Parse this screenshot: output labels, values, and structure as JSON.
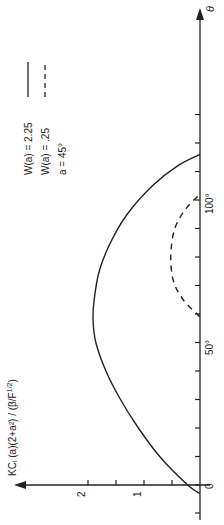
{
  "chart_data": {
    "type": "line",
    "orientation": "rotated-90-ccw",
    "title": "",
    "xlabel": "θ",
    "ylabel": "KCᵢ (a)(2+a²) / (β/F^1/2)",
    "xlim": [
      -5,
      135
    ],
    "ylim": [
      0,
      2.8
    ],
    "x_ticks": [
      0,
      10,
      20,
      30,
      40,
      50,
      60,
      70,
      80,
      90,
      100,
      110,
      120,
      130
    ],
    "x_tick_labels": {
      "0": "0",
      "50": "50°",
      "100": "100°"
    },
    "y_ticks": [
      0,
      0.5,
      1,
      1.5,
      2
    ],
    "y_tick_labels": {
      "1": "1",
      "2": "2"
    },
    "grid": false,
    "legend_position": "upper-left (rotated)",
    "series": [
      {
        "name": "W(a) = 2.25",
        "style": "solid",
        "x": [
          -3,
          0,
          10,
          20,
          30,
          40,
          50,
          58,
          65,
          75,
          85,
          95,
          105,
          112,
          116
        ],
        "values": [
          0,
          0.22,
          0.72,
          1.1,
          1.42,
          1.68,
          1.86,
          1.91,
          1.89,
          1.8,
          1.6,
          1.3,
          0.85,
          0.4,
          0
        ]
      },
      {
        "name": "W(a) = .25",
        "style": "dashed",
        "x": [
          59,
          65,
          72,
          81,
          90,
          97,
          102
        ],
        "values": [
          0,
          0.3,
          0.48,
          0.52,
          0.45,
          0.25,
          0
        ]
      }
    ],
    "annotations": [
      "a = 45°"
    ]
  },
  "legend": {
    "items": [
      {
        "label": "W(a) = 2.25",
        "style": "solid"
      },
      {
        "label": "W(a) = .25",
        "style": "dashed"
      },
      {
        "label": "a = 45°",
        "style": "none"
      }
    ]
  },
  "axes": {
    "theta_label": "θ",
    "value_label": "KCᵢ (a)(2+a²) / (β/F",
    "value_label_sup": "1/2",
    "value_label_end": ")",
    "tick_0": "0",
    "tick_50": "50°",
    "tick_100": "100°",
    "tick_1": "1",
    "tick_2": "2"
  }
}
